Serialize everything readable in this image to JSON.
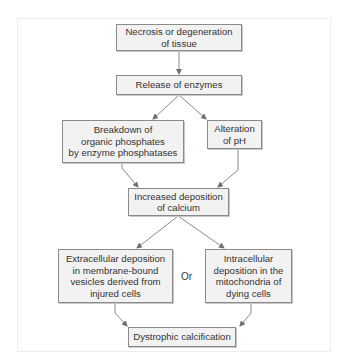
{
  "diagram": {
    "type": "flowchart",
    "colors": {
      "box_fill": "#f2f2f2",
      "box_border": "#8a8a8a",
      "arrow": "#7a7a7a",
      "text": "#333333"
    },
    "nodes": {
      "necrosis": "Necrosis or degeneration\nof tissue",
      "release": "Release of enzymes",
      "breakdown": "Breakdown of\norganic phosphates\nby enzyme phosphatases",
      "alteration": "Alteration\nof pH",
      "increased": "Increased deposition\nof calcium",
      "extracellular": "Extracellular deposition\nin membrane-bound\nvesicles derived from\ninjured cells",
      "intracellular": "Intracellular\ndeposition in the\nmitochondria of\ndying cells",
      "dystrophic": "Dystrophic calcification"
    },
    "connector_label": "Or",
    "edges": [
      [
        "necrosis",
        "release"
      ],
      [
        "release",
        "breakdown"
      ],
      [
        "release",
        "alteration"
      ],
      [
        "breakdown",
        "increased"
      ],
      [
        "alteration",
        "increased"
      ],
      [
        "increased",
        "extracellular"
      ],
      [
        "increased",
        "intracellular"
      ],
      [
        "extracellular",
        "dystrophic"
      ],
      [
        "intracellular",
        "dystrophic"
      ]
    ]
  }
}
